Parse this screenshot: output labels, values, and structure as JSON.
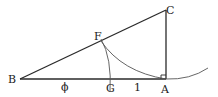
{
  "diagram": {
    "type": "geometry",
    "points": {
      "B": {
        "label": "B"
      },
      "A": {
        "label": "A"
      },
      "C": {
        "label": "C"
      },
      "F": {
        "label": "F"
      },
      "G": {
        "label": "G"
      }
    },
    "segment_labels": {
      "BG": "ϕ",
      "GA": "1"
    },
    "right_angle_at": "A",
    "stroke_color": "#2a2a2a",
    "arc_color": "#555555"
  }
}
